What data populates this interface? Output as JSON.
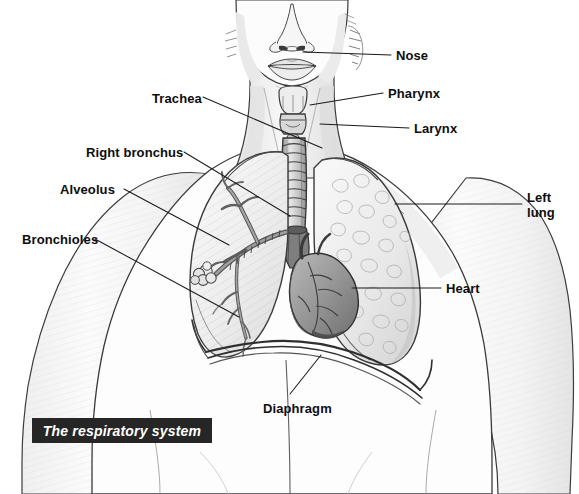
{
  "figure": {
    "title": "The respiratory system",
    "caption": {
      "text": "The respiratory system",
      "background_color": "#262626",
      "text_color": "#ffffff"
    },
    "medium": "pencil sketch",
    "line_color": "#1a1a1a",
    "label_color": "#0d0d0d",
    "background_color": "#ffffff"
  },
  "labels": [
    {
      "id": "nose",
      "text": "Nose",
      "x": 396,
      "y": 48,
      "align": "left"
    },
    {
      "id": "pharynx",
      "text": "Pharynx",
      "x": 388,
      "y": 86,
      "align": "left"
    },
    {
      "id": "larynx",
      "text": "Larynx",
      "x": 414,
      "y": 121,
      "align": "left"
    },
    {
      "id": "trachea",
      "text": "Trachea",
      "x": 152,
      "y": 91,
      "align": "left"
    },
    {
      "id": "right-bronchus",
      "text": "Right bronchus",
      "x": 86,
      "y": 145,
      "align": "left"
    },
    {
      "id": "alveolus",
      "text": "Alveolus",
      "x": 60,
      "y": 182,
      "align": "left"
    },
    {
      "id": "bronchioles",
      "text": "Bronchioles",
      "x": 22,
      "y": 232,
      "align": "left"
    },
    {
      "id": "left-lung",
      "text": "Left\nlung",
      "x": 527,
      "y": 190,
      "align": "left"
    },
    {
      "id": "heart",
      "text": "Heart",
      "x": 446,
      "y": 281,
      "align": "left"
    },
    {
      "id": "diaphragm",
      "text": "Diaphragm",
      "x": 263,
      "y": 401,
      "align": "left"
    }
  ],
  "leader_lines": [
    {
      "id": "nose",
      "from": [
        391,
        55
      ],
      "to": [
        303,
        52
      ]
    },
    {
      "id": "pharynx",
      "from": [
        383,
        93
      ],
      "to": [
        310,
        105
      ]
    },
    {
      "id": "larynx",
      "from": [
        409,
        128
      ],
      "to": [
        320,
        124
      ]
    },
    {
      "id": "trachea",
      "from": [
        203,
        97
      ],
      "to": [
        322,
        148
      ]
    },
    {
      "id": "right-bronchus",
      "from": [
        184,
        152
      ],
      "to": [
        290,
        216
      ]
    },
    {
      "id": "alveolus",
      "from": [
        124,
        189
      ],
      "to": [
        229,
        245
      ]
    },
    {
      "id": "bronchioles",
      "from": [
        95,
        239
      ],
      "to": [
        239,
        317
      ]
    },
    {
      "id": "left-lung",
      "from": [
        522,
        204
      ],
      "to": [
        395,
        204
      ]
    },
    {
      "id": "heart",
      "from": [
        441,
        288
      ],
      "to": [
        352,
        288
      ]
    },
    {
      "id": "diaphragm",
      "from": [
        290,
        394
      ],
      "to": [
        321,
        355
      ]
    }
  ]
}
